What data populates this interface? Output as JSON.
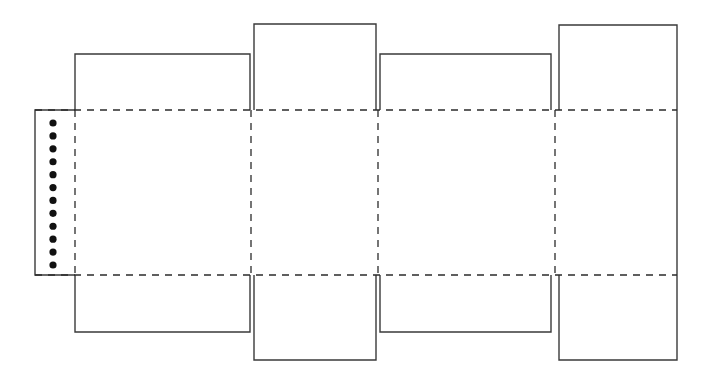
{
  "document": {
    "title": "Carton Dieline Template",
    "width": 711,
    "height": 380,
    "background_color": "#ffffff"
  },
  "style": {
    "cut_line_color": "#3a3a3a",
    "cut_line_width": 1.4,
    "fold_line_color": "#2b2b2b",
    "fold_line_width": 1.3,
    "fold_dash_pattern": "7,6",
    "glue_dot_color": "#111111",
    "glue_dot_radius": 3.6
  },
  "geometry": {
    "body_top_y": 110,
    "body_bottom_y": 275,
    "body_left_x": 35,
    "body_right_x": 677,
    "fold_x_positions": [
      75,
      251,
      378,
      555
    ],
    "right_edge_x": 677
  },
  "glue_flap": {
    "label": "glue-flap",
    "x": 35,
    "y": 110,
    "width": 40,
    "height": 165,
    "dot_count": 12,
    "dot_center_x": 53,
    "dot_first_y": 123,
    "dot_last_y": 265
  },
  "panels": [
    {
      "name": "panel-front",
      "left_x": 75,
      "right_x": 251,
      "top_flap": {
        "name": "top-flap-front",
        "left_x": 75,
        "right_x": 250,
        "top_y": 54,
        "bottom_y": 110
      },
      "bottom_flap": {
        "name": "bottom-flap-front",
        "left_x": 75,
        "right_x": 250,
        "top_y": 275,
        "bottom_y": 332
      }
    },
    {
      "name": "panel-side-left",
      "left_x": 251,
      "right_x": 378,
      "top_flap": {
        "name": "top-flap-side-left",
        "left_x": 254,
        "right_x": 376,
        "top_y": 24,
        "bottom_y": 110
      },
      "bottom_flap": {
        "name": "bottom-flap-side-left",
        "left_x": 254,
        "right_x": 376,
        "top_y": 275,
        "bottom_y": 360
      }
    },
    {
      "name": "panel-back",
      "left_x": 378,
      "right_x": 555,
      "top_flap": {
        "name": "top-flap-back",
        "left_x": 380,
        "right_x": 551,
        "top_y": 54,
        "bottom_y": 110
      },
      "bottom_flap": {
        "name": "bottom-flap-back",
        "left_x": 380,
        "right_x": 551,
        "top_y": 275,
        "bottom_y": 332
      }
    },
    {
      "name": "panel-side-right",
      "left_x": 555,
      "right_x": 677,
      "top_flap": {
        "name": "top-flap-side-right",
        "left_x": 559,
        "right_x": 677,
        "top_y": 25,
        "bottom_y": 110
      },
      "bottom_flap": {
        "name": "bottom-flap-side-right",
        "left_x": 559,
        "right_x": 677,
        "top_y": 275,
        "bottom_y": 360
      }
    }
  ]
}
